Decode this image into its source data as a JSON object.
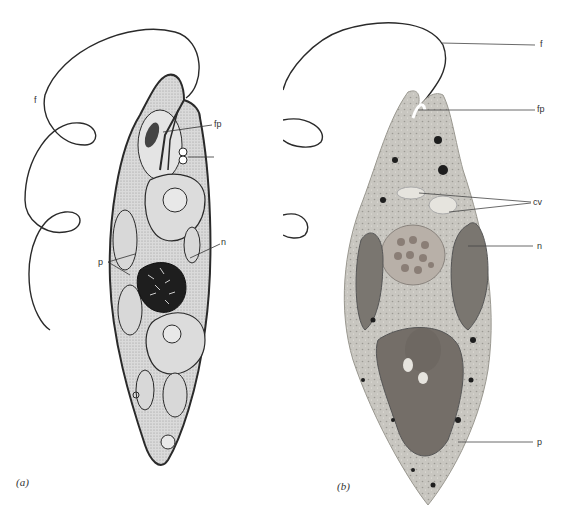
{
  "figure": {
    "panels": [
      {
        "id": "a",
        "panel_label": "(a)",
        "style": "line drawing",
        "labels": {
          "flagellum": "f",
          "flagellar_pocket": "fp",
          "nucleus": "n",
          "plastids": "p"
        }
      },
      {
        "id": "b",
        "panel_label": "(b)",
        "style": "micrograph",
        "labels": {
          "flagellum": "f",
          "flagellar_pocket": "fp",
          "contractile_vacuole": "cv",
          "nucleus": "n",
          "plastid": "p"
        }
      }
    ]
  },
  "colors": {
    "line": "#2a2a2a",
    "cell_fill_a": "#d6d6d6",
    "cell_fill_b": "#c4c2bc",
    "nucleus_dark": "#1e1e1e",
    "plastid_b": "#7a7670"
  }
}
